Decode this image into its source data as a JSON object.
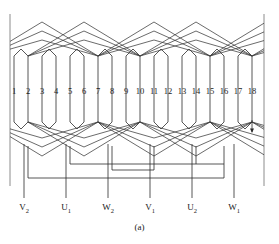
{
  "figure": {
    "caption": "(a)",
    "slot_count": 18,
    "slot_numbers": [
      "1",
      "2",
      "3",
      "4",
      "5",
      "6",
      "7",
      "8",
      "9",
      "10",
      "11",
      "12",
      "13",
      "14",
      "15",
      "16",
      "17",
      "18"
    ],
    "slot_x": [
      14,
      28,
      42,
      56,
      70,
      84,
      98,
      112,
      126,
      140,
      154,
      168,
      182,
      196,
      210,
      224,
      238,
      252
    ],
    "slot_label_y": 94,
    "colors": {
      "wire": "#2b2b2b",
      "frame": "#6e6e6e",
      "background": "#ffffff",
      "text": "#1a1a1a"
    },
    "geometry": {
      "core_top_y": 68,
      "core_bottom_y": 110,
      "upper_end_top_y": 22,
      "lower_end_bottom_y": 156,
      "bus1_y": 170,
      "bus2_y": 178,
      "lead_bottom_y": 198,
      "frame_left_x": 10,
      "frame_right_x": 264,
      "frame_top_y": 14,
      "frame_bottom_y": 186,
      "coil_span": 8,
      "arrow_slot_index": 17
    },
    "terminals": [
      {
        "name": "V2",
        "label": "V",
        "sub": "2",
        "x": 24,
        "lead_from_slot": 2
      },
      {
        "name": "U1",
        "label": "U",
        "sub": "1",
        "x": 66,
        "lead_from_slot": 4
      },
      {
        "name": "W2",
        "label": "W",
        "sub": "2",
        "x": 108,
        "lead_from_slot": 8
      },
      {
        "name": "V1",
        "label": "V",
        "sub": "1",
        "x": 150,
        "lead_from_slot": 11
      },
      {
        "name": "U2",
        "label": "U",
        "sub": "2",
        "x": 192,
        "lead_from_slot": 13
      },
      {
        "name": "W1",
        "label": "W",
        "sub": "1",
        "x": 234,
        "lead_from_slot": 16
      }
    ],
    "terminal_label_y": 202
  }
}
